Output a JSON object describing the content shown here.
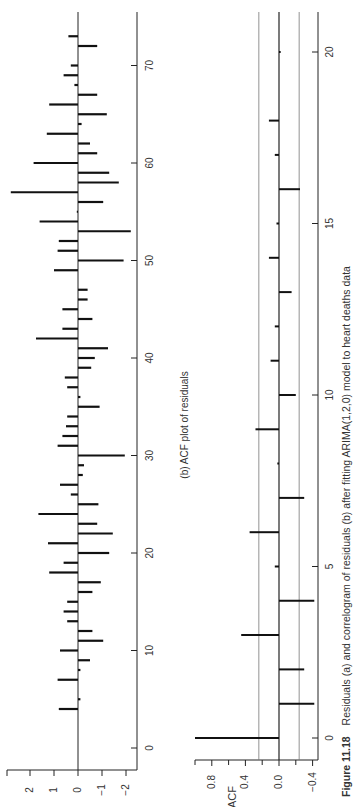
{
  "figure": {
    "caption_label": "Figure 11.18",
    "caption_text": "Residuals (a) and correlogram of residuals (b) after fitting ARIMA(1,2,0) model to heart deaths data",
    "orientation": "rotated 90° counter-clockwise"
  },
  "chart_data": [
    {
      "type": "bar",
      "panel": "a",
      "title": "",
      "xlabel": "",
      "ylabel": "",
      "x_ticks": [
        0,
        10,
        20,
        30,
        40,
        50,
        60,
        70
      ],
      "y_ticks": [
        2,
        1,
        0,
        -1,
        -2
      ],
      "y_tick_labels": [
        "2",
        "1",
        "0",
        "−1",
        "−2"
      ],
      "ylim": [
        -2.3,
        3.0
      ],
      "xlim": [
        -2,
        74
      ],
      "grid": false,
      "x": [
        4,
        5,
        7,
        8,
        9,
        10,
        11,
        12,
        13,
        14,
        15,
        16,
        17,
        18,
        19,
        20,
        21,
        22,
        23,
        24,
        25,
        26,
        27,
        28,
        29,
        30,
        31,
        32,
        33,
        34,
        35,
        36,
        37,
        38,
        39,
        40,
        41,
        42,
        43,
        44,
        45,
        46,
        47,
        49,
        50,
        51,
        52,
        53,
        54,
        55,
        56,
        57,
        58,
        59,
        60,
        61,
        62,
        63,
        64,
        65,
        66,
        67,
        68,
        69,
        70,
        72,
        73
      ],
      "values": [
        0.8,
        -0.1,
        0.85,
        -0.1,
        -0.5,
        0.75,
        -1.05,
        -0.6,
        0.45,
        0.6,
        0.45,
        -0.6,
        -0.95,
        1.2,
        0.6,
        -1.3,
        1.25,
        -1.45,
        -0.8,
        1.65,
        -0.85,
        0.3,
        0.75,
        -0.2,
        -0.25,
        -1.95,
        0.85,
        0.65,
        0.5,
        0.45,
        -0.9,
        -0.1,
        0.45,
        0.55,
        -0.55,
        -0.7,
        -1.25,
        1.75,
        0.65,
        -0.6,
        0.65,
        -0.4,
        -0.4,
        1.0,
        -1.9,
        0.85,
        0.8,
        -2.2,
        1.6,
        0.05,
        -1.05,
        2.8,
        -1.7,
        -1.3,
        1.85,
        -0.8,
        -0.5,
        1.3,
        -0.15,
        -1.2,
        1.2,
        -0.8,
        0.15,
        0.6,
        0.3,
        -0.8,
        0.4
      ]
    },
    {
      "type": "bar",
      "panel": "b",
      "title": "(b) ACF plot of residuals",
      "xlabel": "",
      "ylabel": "ACF",
      "x_ticks": [
        0,
        5,
        10,
        15,
        20
      ],
      "y_ticks": [
        0.8,
        0.4,
        0.0,
        -0.4
      ],
      "y_tick_labels": [
        "0.8",
        "0.4",
        "0.0",
        "−0.4"
      ],
      "y_minor_ticks": [
        1.0,
        0.6,
        0.2,
        -0.2
      ],
      "ylim": [
        -0.45,
        1.05
      ],
      "xlim": [
        -0.7,
        20.8
      ],
      "grid": false,
      "confidence_bounds": [
        0.24,
        -0.24
      ],
      "lags": [
        0,
        1,
        2,
        3,
        4,
        5,
        6,
        7,
        8,
        9,
        10,
        11,
        12,
        13,
        14,
        15,
        16,
        17,
        18,
        19,
        20
      ],
      "values": [
        1.0,
        -0.42,
        -0.3,
        0.45,
        -0.42,
        0.05,
        0.35,
        -0.3,
        0.02,
        0.28,
        -0.2,
        0.1,
        0.05,
        -0.15,
        0.12,
        0.03,
        -0.25,
        0.05,
        0.12,
        0.0,
        -0.02
      ]
    }
  ]
}
